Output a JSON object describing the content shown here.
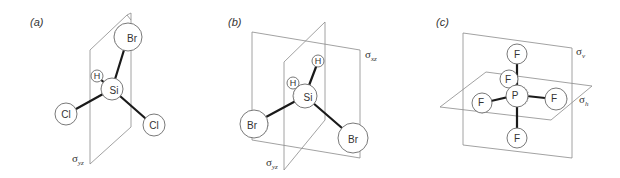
{
  "figure": {
    "panels": [
      {
        "label": "(a)",
        "molecule": "SiH(Br)Cl2",
        "atoms": {
          "br": "Br",
          "h": "H",
          "si": "Si",
          "cl_left": "Cl",
          "cl_right": "Cl"
        },
        "planes": [
          {
            "symbol": "σ",
            "subscript": "yz"
          }
        ]
      },
      {
        "label": "(b)",
        "molecule": "SiH2Br2",
        "atoms": {
          "h_top": "H",
          "h_left": "H",
          "si": "Si",
          "br_left": "Br",
          "br_right": "Br"
        },
        "planes": [
          {
            "symbol": "σ",
            "subscript": "xz"
          },
          {
            "symbol": "σ",
            "subscript": "yz"
          }
        ]
      },
      {
        "label": "(c)",
        "molecule": "PF5",
        "atoms": {
          "p": "P",
          "f_top": "F",
          "f_back": "F",
          "f_left": "F",
          "f_right": "F",
          "f_bottom": "F"
        },
        "planes": [
          {
            "symbol": "σ",
            "subscript": "v"
          },
          {
            "symbol": "σ",
            "subscript": "h"
          }
        ]
      }
    ],
    "colors": {
      "background": "#ffffff",
      "bond": "#1a1a1a",
      "plane": "#8a8a8a",
      "text": "#333333"
    }
  }
}
